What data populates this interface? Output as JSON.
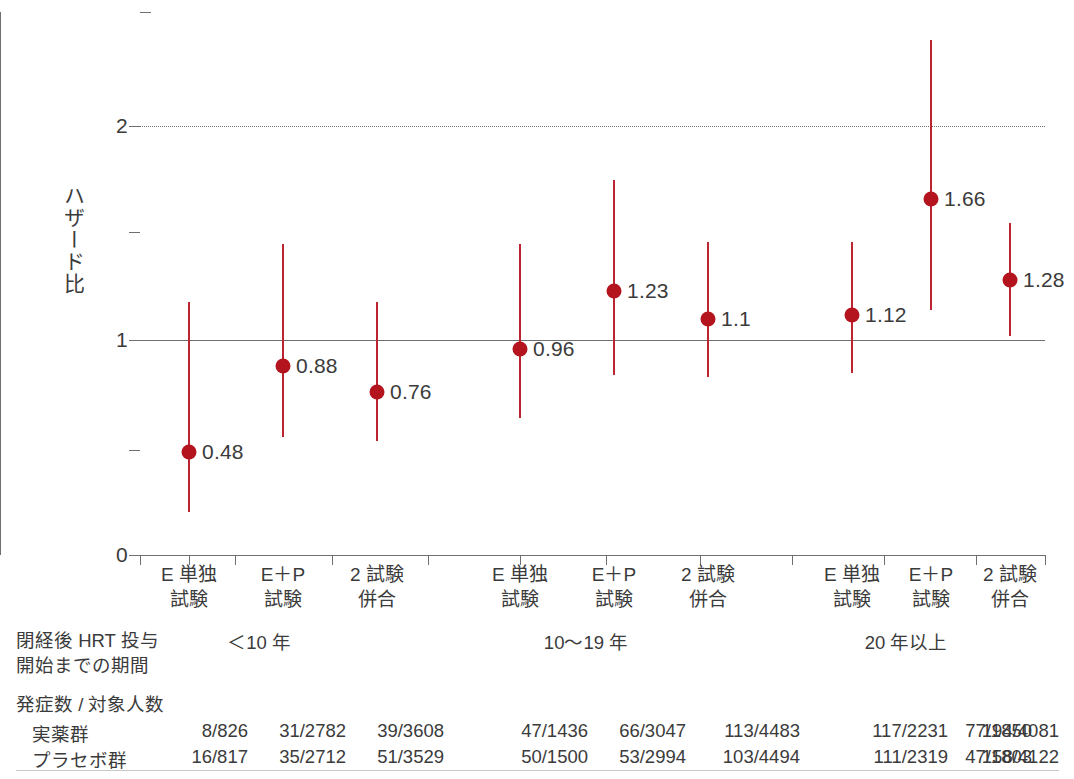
{
  "chart_data": {
    "type": "scatter",
    "title": "",
    "ylabel": "ハザード比",
    "xlabel": "",
    "ylim": [
      0,
      2.4
    ],
    "yticks": [
      0,
      0.5,
      1.0,
      1.5,
      2.0
    ],
    "ytick_labels": [
      "0",
      "",
      "1",
      "",
      "2"
    ],
    "reference_lines": [
      {
        "value": 1.0,
        "style": "solid"
      },
      {
        "value": 2.0,
        "style": "dotted"
      }
    ],
    "grid": false,
    "legend": "none",
    "categories": [
      "E 単独\n試験",
      "E＋P\n試験",
      "2 試験\n併合"
    ],
    "groups": [
      {
        "name": "＜10 年",
        "points": [
          {
            "category": "E 単独試験",
            "value": 0.48,
            "label": "0.48",
            "ci_low": 0.2,
            "ci_high": 1.18
          },
          {
            "category": "E＋P試験",
            "value": 0.88,
            "label": "0.88",
            "ci_low": 0.55,
            "ci_high": 1.45
          },
          {
            "category": "2 試験併合",
            "value": 0.76,
            "label": "0.76",
            "ci_low": 0.53,
            "ci_high": 1.18
          }
        ]
      },
      {
        "name": "10〜19 年",
        "points": [
          {
            "category": "E 単独試験",
            "value": 0.96,
            "label": "0.96",
            "ci_low": 0.64,
            "ci_high": 1.45
          },
          {
            "category": "E＋P試験",
            "value": 1.23,
            "label": "1.23",
            "ci_low": 0.84,
            "ci_high": 1.75
          },
          {
            "category": "2 試験併合",
            "value": 1.1,
            "label": "1.1",
            "ci_low": 0.83,
            "ci_high": 1.46
          }
        ]
      },
      {
        "name": "20 年以上",
        "points": [
          {
            "category": "E 単独試験",
            "value": 1.12,
            "label": "1.12",
            "ci_low": 0.85,
            "ci_high": 1.46
          },
          {
            "category": "E＋P試験",
            "value": 1.66,
            "label": "1.66",
            "ci_low": 1.14,
            "ci_high": 2.4
          },
          {
            "category": "2 試験併合",
            "value": 1.28,
            "label": "1.28",
            "ci_low": 1.02,
            "ci_high": 1.55
          }
        ]
      }
    ],
    "colors": {
      "marker": "#b3141d",
      "errorbar": "#bb2430",
      "axis": "#6f6f6f",
      "text": "#3b3b3b"
    }
  },
  "axis": {
    "y_title": "ハザード比",
    "tick_labels": {
      "zero": "0",
      "one": "1",
      "two": "2"
    }
  },
  "categories": [
    {
      "line1": "E 単独",
      "line2": "試験"
    },
    {
      "line1": "E＋P",
      "line2": "試験"
    },
    {
      "line1": "2 試験",
      "line2": "併合"
    },
    {
      "line1": "E 単独",
      "line2": "試験"
    },
    {
      "line1": "E＋P",
      "line2": "試験"
    },
    {
      "line1": "2 試験",
      "line2": "併合"
    },
    {
      "line1": "E 単独",
      "line2": "試験"
    },
    {
      "line1": "E＋P",
      "line2": "試験"
    },
    {
      "line1": "2 試験",
      "line2": "併合"
    }
  ],
  "markers": [
    {
      "label": "0.48"
    },
    {
      "label": "0.88"
    },
    {
      "label": "0.76"
    },
    {
      "label": "0.96"
    },
    {
      "label": "1.23"
    },
    {
      "label": "1.1"
    },
    {
      "label": "1.12"
    },
    {
      "label": "1.66"
    },
    {
      "label": "1.28"
    }
  ],
  "annotation": {
    "period_label": "閉経後 HRT 投与\n開始までの期間",
    "group_headers": [
      "＜10 年",
      "10〜19 年",
      "20 年以上"
    ],
    "counts_title": "発症数 / 対象人数",
    "row_labels": [
      "実薬群",
      "プラセボ群"
    ],
    "active_group": [
      "8/826",
      "31/2782",
      "39/3608",
      "47/1436",
      "66/3047",
      "113/4483",
      "117/2231",
      "77/1850",
      "194/4081"
    ],
    "placebo_group": [
      "16/817",
      "35/2712",
      "51/3529",
      "50/1500",
      "53/2994",
      "103/4494",
      "111/2319",
      "47/1803",
      "158/4122"
    ]
  }
}
